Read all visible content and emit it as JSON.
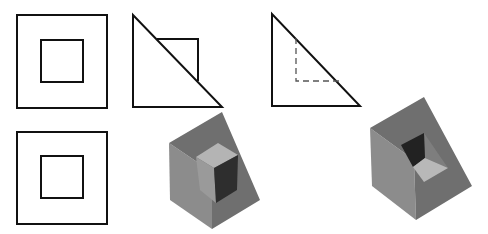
{
  "figure": {
    "views": [
      {
        "id": "front-view-top-left",
        "type": "square-in-square"
      },
      {
        "id": "side-view-top-middle",
        "type": "triangle-with-solid-square"
      },
      {
        "id": "side-view-top-right",
        "type": "triangle-with-dashed-hidden-lines"
      },
      {
        "id": "top-view-bottom-left",
        "type": "square-in-square"
      }
    ],
    "solids": [
      {
        "id": "wedge-with-protruding-cube",
        "position": "bottom-middle"
      },
      {
        "id": "wedge-with-cubic-cavity",
        "position": "bottom-right"
      }
    ]
  },
  "colors": {
    "line": "#111111",
    "hidden_line": "#555555",
    "left_face": "#8c8c8c",
    "slope_face": "#6f6f6f",
    "cube_top": "#b4b4b4",
    "cube_dark": "#2e2e2e",
    "cube_side": "#9a9a9a",
    "cavity_floor": "#b8b8b8",
    "cavity_wall": "#222222",
    "cavity_side": "#7e7e7e"
  }
}
